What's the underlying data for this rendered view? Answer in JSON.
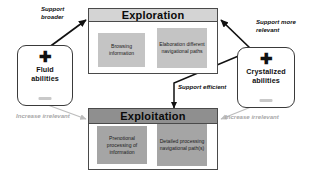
{
  "diagram": {
    "nodes": {
      "fluid": {
        "label": "Fluid\nabilities",
        "sign": "✚"
      },
      "crystalized": {
        "label": "Crystalized\nabilities",
        "sign": "✚"
      }
    },
    "groups": {
      "exploration": {
        "title": "Exploration",
        "header_color": "#d4d4d4",
        "body_color": "#ffffff",
        "sub_color": "#c4c4c4",
        "subboxes": [
          {
            "text": "Browsing\ninformation"
          },
          {
            "text": "Elaboration\ndifferent\nnavigational\npaths"
          }
        ]
      },
      "exploitation": {
        "title": "Exploitation",
        "header_color": "#8f8f8f",
        "body_color": "#ffffff",
        "sub_color": "#a5a5a5",
        "subboxes": [
          {
            "text": "Prenotional\nprocessing of\ninformation"
          },
          {
            "text": "Detailed\nprocessing\nnavigational\npath(s)"
          }
        ]
      }
    },
    "edges": [
      {
        "id": "support-broader",
        "label": "Support\nbroader",
        "style": "dark"
      },
      {
        "id": "support-more-relevant",
        "label": "Support more\nrelevant",
        "style": "dark"
      },
      {
        "id": "support-efficient",
        "label": "Support efficient",
        "style": "dark"
      },
      {
        "id": "increase-irrelevant-left",
        "label": "Increase irrelevant",
        "style": "grey"
      },
      {
        "id": "increase-irrelevant-right",
        "label": "Increase irrelevant",
        "style": "grey"
      }
    ],
    "colors": {
      "arrow_dark": "#111111",
      "arrow_grey": "#bdbdbd",
      "border": "#4a4a4a"
    }
  }
}
